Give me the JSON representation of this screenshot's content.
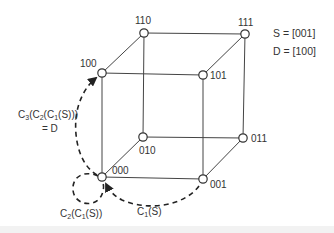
{
  "diagram": {
    "title": "",
    "type": "3-cube routing (hypercube)",
    "stroke_color": "#444444",
    "path_color": "#222222",
    "source_dest": {
      "source_label": "S = [001]",
      "dest_label": "D = [100]"
    },
    "nodes": [
      {
        "id": "000",
        "label": "000",
        "x": 102,
        "y": 177
      },
      {
        "id": "001",
        "label": "001",
        "x": 203,
        "y": 179
      },
      {
        "id": "010",
        "label": "010",
        "x": 143,
        "y": 137
      },
      {
        "id": "011",
        "label": "011",
        "x": 243,
        "y": 138
      },
      {
        "id": "100",
        "label": "100",
        "x": 102,
        "y": 73
      },
      {
        "id": "101",
        "label": "101",
        "x": 203,
        "y": 75
      },
      {
        "id": "110",
        "label": "110",
        "x": 144,
        "y": 33
      },
      {
        "id": "111",
        "label": "111",
        "x": 245,
        "y": 34
      }
    ],
    "edges": [
      [
        "000",
        "001"
      ],
      [
        "000",
        "010"
      ],
      [
        "000",
        "100"
      ],
      [
        "001",
        "011"
      ],
      [
        "001",
        "101"
      ],
      [
        "010",
        "011"
      ],
      [
        "010",
        "110"
      ],
      [
        "011",
        "111"
      ],
      [
        "100",
        "101"
      ],
      [
        "100",
        "110"
      ],
      [
        "101",
        "111"
      ],
      [
        "110",
        "111"
      ]
    ],
    "routing_steps": [
      {
        "label": "C1(S)",
        "from": "001",
        "to": "000"
      },
      {
        "label": "C2(C1(S))",
        "from": "000",
        "to": "000"
      },
      {
        "label": "C3(C2(C1(S))) = D",
        "from": "000",
        "to": "100"
      }
    ],
    "annotations": {
      "c1": {
        "main": "C",
        "sub": "1",
        "rest": "(S)"
      },
      "c2": {
        "main": "C",
        "sub1": "2",
        "mid": "(C",
        "sub2": "1",
        "rest": "(S))"
      },
      "c3": {
        "main": "C",
        "sub1": "3",
        "mid1": "(C",
        "sub2": "2",
        "mid2": "(C",
        "sub3": "1",
        "rest": "(S)))",
        "line2": "= D"
      }
    }
  }
}
